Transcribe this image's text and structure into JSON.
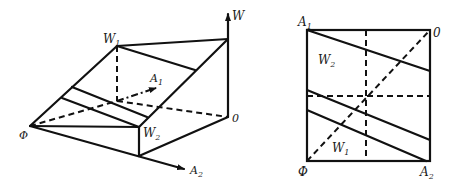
{
  "left_figure": {
    "labels": {
      "W": "W",
      "W1": "W",
      "W1_sub": "1",
      "W2": "W",
      "W2_sub": "2",
      "A1": "A",
      "A1_sub": "1",
      "A2": "A",
      "A2_sub": "2",
      "origin": "0",
      "phi": "Φ"
    }
  },
  "right_figure": {
    "labels": {
      "A1": "A",
      "A1_sub": "1",
      "A2": "A",
      "A2_sub": "2",
      "W1": "W",
      "W1_sub": "1",
      "W2": "W",
      "W2_sub": "2",
      "origin": "0",
      "phi": "Φ"
    }
  },
  "colors": {
    "line": "#111111",
    "background": "#ffffff"
  }
}
